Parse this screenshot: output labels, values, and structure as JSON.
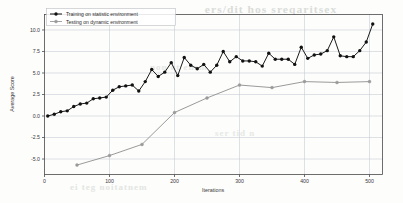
{
  "chart_data": {
    "type": "line",
    "title": "",
    "xlabel": "Iterations",
    "ylabel": "Average Score",
    "xlim": [
      0,
      520
    ],
    "ylim": [
      -6.8,
      11.8
    ],
    "xticks": [
      0,
      100,
      200,
      300,
      400,
      500
    ],
    "xticklabels": [
      "0",
      "100",
      "200",
      "300",
      "400",
      "500"
    ],
    "yticks": [
      -5.0,
      -2.5,
      0.0,
      2.5,
      5.0,
      7.5,
      10.0
    ],
    "yticklabels": [
      "-5.0",
      "-2.5",
      "0.0",
      "2.5",
      "5.0",
      "7.5",
      "10.0"
    ],
    "grid": true,
    "legend_position": "upper left",
    "series": [
      {
        "name": "Training on statistic environment",
        "color": "#111111",
        "marker": "circle",
        "x": [
          5,
          15,
          25,
          35,
          45,
          55,
          65,
          75,
          85,
          95,
          105,
          115,
          125,
          135,
          145,
          155,
          165,
          175,
          185,
          195,
          205,
          215,
          225,
          235,
          245,
          255,
          265,
          275,
          285,
          295,
          305,
          315,
          325,
          335,
          345,
          355,
          365,
          375,
          385,
          395,
          405,
          415,
          425,
          435,
          445,
          455,
          465,
          475,
          485,
          495,
          505
        ],
        "y": [
          0.0,
          0.2,
          0.5,
          0.6,
          1.1,
          1.4,
          1.5,
          2.0,
          2.1,
          2.2,
          3.0,
          3.4,
          3.5,
          3.6,
          2.9,
          4.0,
          5.4,
          4.6,
          5.1,
          6.2,
          4.7,
          6.8,
          5.9,
          5.5,
          6.0,
          5.1,
          5.9,
          7.5,
          6.3,
          6.9,
          6.4,
          6.4,
          6.3,
          5.8,
          7.3,
          6.6,
          6.6,
          6.6,
          6.0,
          8.0,
          6.7,
          7.1,
          7.2,
          7.6,
          9.2,
          7.0,
          6.9,
          6.9,
          7.6,
          8.6,
          10.7
        ]
      },
      {
        "name": "Testing on dynamic environment",
        "color": "#9a9a9a",
        "marker": "circle",
        "x": [
          50,
          100,
          150,
          200,
          250,
          300,
          350,
          400,
          450,
          500
        ],
        "y": [
          -5.7,
          -4.6,
          -3.3,
          0.4,
          2.1,
          3.6,
          3.3,
          4.0,
          3.9,
          4.0
        ]
      }
    ]
  },
  "legend": {
    "items": [
      {
        "label": "Training on statistic environment"
      },
      {
        "label": "Testing on dynamic environment"
      }
    ]
  },
  "artifacts": {
    "bleed_top": "ers/dit hos  sreqaritsex",
    "bleed_mid": "non ot ensm",
    "bleed_low": "ser  tid n",
    "bleed_bot": "ei teg  noitatnem"
  }
}
